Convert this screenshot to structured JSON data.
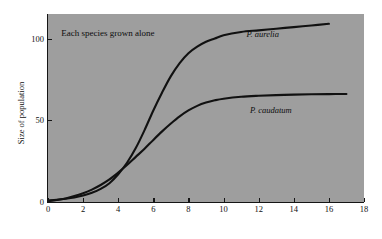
{
  "figure": {
    "background_color": "#ffffff",
    "plot_background_color": "#9e9e9e",
    "axis_color": "#151515",
    "curve_color": "#111111",
    "annotation": "Each species grown alone"
  },
  "axes": {
    "x": {
      "label": "",
      "ticks": [
        "0",
        "2",
        "4",
        "6",
        "8",
        "10",
        "12",
        "14",
        "16",
        "18"
      ],
      "min": 0,
      "max": 18
    },
    "y": {
      "label": "Size of population",
      "ticks": [
        "0",
        "50",
        "100"
      ],
      "min": 0,
      "max": 115
    }
  },
  "chart_data": {
    "type": "line",
    "title": "",
    "subtitle": "",
    "xlabel": "",
    "ylabel": "Size of population",
    "xlim": [
      0,
      18
    ],
    "ylim": [
      0,
      115
    ],
    "grid": false,
    "legend": "inline-curve-labels",
    "annotations": [
      {
        "text": "Each species grown alone",
        "x": 0.75,
        "y": 103
      }
    ],
    "series": [
      {
        "name": "P. aurelia",
        "label_x": 11.3,
        "label_y": 102,
        "x": [
          0,
          0.5,
          1,
          1.5,
          2,
          2.5,
          3,
          3.5,
          4,
          4.5,
          5,
          5.5,
          6,
          6.5,
          7,
          7.5,
          8,
          8.5,
          9,
          9.5,
          10,
          11,
          12,
          13,
          14,
          15,
          16
        ],
        "y": [
          1,
          1.4,
          2,
          2.8,
          4,
          5.6,
          8,
          11.5,
          17,
          24,
          33,
          44,
          56,
          67,
          77,
          85,
          91,
          95,
          98,
          100,
          102,
          104,
          105,
          106,
          107,
          108,
          109
        ]
      },
      {
        "name": "P. caudatum",
        "label_x": 11.5,
        "label_y": 56,
        "x": [
          0,
          0.5,
          1,
          1.5,
          2,
          2.5,
          3,
          3.5,
          4,
          4.5,
          5,
          5.5,
          6,
          6.5,
          7,
          7.5,
          8,
          8.5,
          9,
          9.5,
          10,
          11,
          12,
          13,
          14,
          15,
          16,
          17
        ],
        "y": [
          0.5,
          1.2,
          2.2,
          3.6,
          5.4,
          7.6,
          10.4,
          13.8,
          18,
          22.6,
          27.6,
          32.6,
          38,
          43.2,
          48,
          52.4,
          56,
          58.8,
          60.8,
          62.2,
          63.2,
          64.4,
          65,
          65.4,
          65.7,
          65.9,
          66,
          66.1
        ]
      }
    ]
  }
}
